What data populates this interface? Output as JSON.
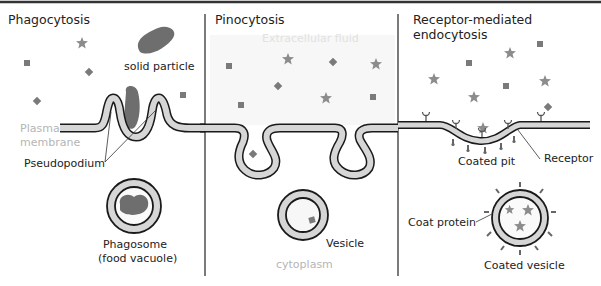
{
  "panels": [
    {
      "id": "phagocytosis",
      "title": "Phagocytosis",
      "labels": {
        "particle": "solid particle",
        "membrane_line1": "Plasma",
        "membrane_line2": "membrane",
        "pseudopodium": "Pseudopodium",
        "result_line1": "Phagosome",
        "result_line2": "(food vacuole)"
      }
    },
    {
      "id": "pinocytosis",
      "title": "Pinocytosis",
      "labels": {
        "extracellular": "Extracellular fluid",
        "vesicle": "Vesicle",
        "cytoplasm": "cytoplasm"
      }
    },
    {
      "id": "receptor-mediated",
      "title_line1": "Receptor-mediated",
      "title_line2": "endocytosis",
      "labels": {
        "coated_pit": "Coated pit",
        "receptor": "Receptor",
        "coat_protein": "Coat protein",
        "coated_vesicle": "Coated vesicle"
      }
    }
  ],
  "colors": {
    "membrane_fill": "#d6d6d6",
    "membrane_stroke": "#1a1a1a",
    "particle": "#6e6e6e",
    "solute": "#8c8c8c",
    "divider": "#222222",
    "top_border": "#333333",
    "faint_text": "#b5b5b5"
  }
}
